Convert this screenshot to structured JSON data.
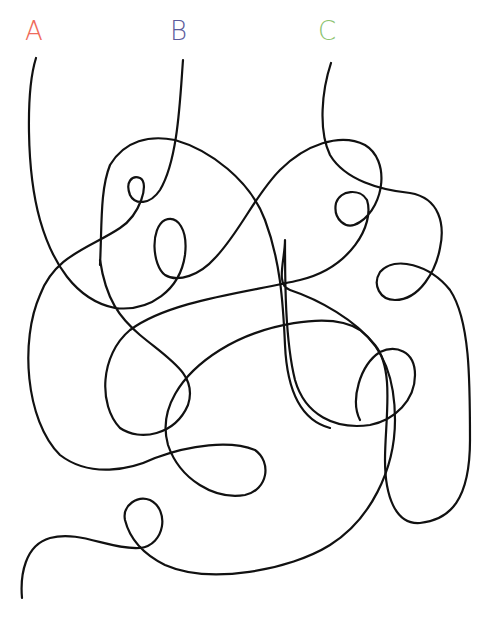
{
  "puzzle": {
    "type": "tangled-lines",
    "labels": [
      {
        "id": "A",
        "text": "A",
        "color": "#ef6b5b",
        "x": 25,
        "y": 18
      },
      {
        "id": "B",
        "text": "B",
        "color": "#5b5b9b",
        "x": 170,
        "y": 18
      },
      {
        "id": "C",
        "text": "C",
        "color": "#8cc36f",
        "x": 318,
        "y": 18
      }
    ],
    "line_color": "#111111",
    "paths": [
      {
        "id": "line-A",
        "d": "M36,58 C26,90 26,170 40,220 C52,262 75,300 115,308 C150,312 180,290 185,255 C188,230 178,215 165,220 C150,228 152,265 165,275 C178,283 200,275 215,258 C240,232 255,195 280,170 C305,145 340,132 365,145 C390,160 385,205 360,222 C345,232 333,218 336,203 C340,190 360,188 367,200 C375,225 350,268 300,280 C250,292 170,300 130,330 C100,355 98,405 120,428 C140,442 175,435 188,405 C198,375 170,360 140,335 C120,318 106,300 100,260"
      },
      {
        "id": "line-B",
        "d": "M183,60 C180,100 178,160 160,190 C150,205 135,205 130,195 C125,182 132,175 140,178 C150,183 140,215 120,228 C90,248 55,255 40,295 C20,340 25,420 60,455 C90,478 130,470 155,458 C190,445 230,440 255,450 C272,462 268,490 245,495 C215,500 180,480 168,445 C158,410 180,375 220,350 C260,325 330,310 360,330 C385,350 395,380 395,420 C395,470 370,520 330,545 C290,570 210,585 165,565 C145,555 130,540 125,520 C122,505 138,495 150,500 C170,510 165,545 140,548 C110,550 80,530 50,538 C25,545 20,575 22,598"
      },
      {
        "id": "line-C",
        "d": "M331,63 C322,90 318,130 330,155 C345,180 380,190 410,193 C440,198 445,225 440,248 C436,270 420,300 395,300 C380,300 372,285 380,272 C395,255 430,265 450,290 C470,320 470,380 470,440 C470,500 450,520 420,523 C395,525 385,495 385,460 C385,420 395,370 375,345 C355,320 320,300 290,290 C275,285 285,260 285,240 C285,280 285,340 295,380 C305,415 335,430 370,425 C395,420 415,400 415,375 C415,350 395,345 380,352 C360,365 350,400 360,420"
      },
      {
        "id": "line-extra",
        "d": "M100,265 C102,225 100,190 110,165 C125,140 150,135 175,140 C210,150 250,180 265,220 C280,260 283,300 285,345 C287,390 300,420 330,428"
      }
    ]
  }
}
